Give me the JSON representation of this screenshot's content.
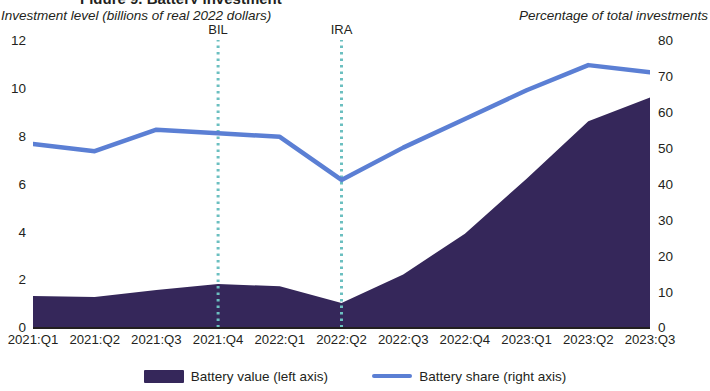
{
  "title_clipped": "Figure 9. Battery investment",
  "axes": {
    "left_title": "Investment level (billions of real 2022 dollars)",
    "right_title": "Percentage of total investments",
    "left_ticks": [
      "12",
      "10",
      "8",
      "6",
      "4",
      "2",
      "0"
    ],
    "right_ticks": [
      "80",
      "70",
      "60",
      "50",
      "40",
      "30",
      "20",
      "10",
      "0"
    ]
  },
  "annotations": [
    {
      "label": "BIL",
      "at_category": "2021:Q4"
    },
    {
      "label": "IRA",
      "at_category": "2022:Q2"
    }
  ],
  "legend": {
    "items": [
      {
        "name": "battery-value",
        "label": "Battery value (left axis)",
        "marker": "area-swatch",
        "color": "#35275a"
      },
      {
        "name": "battery-share",
        "label": "Battery share (right axis)",
        "marker": "line-swatch",
        "color": "#5b7fd4"
      }
    ]
  },
  "colors": {
    "area": "#35275a",
    "line": "#5b7fd4",
    "annotation_line": "#6bbfc0",
    "axis": "#231f20",
    "background": "#ffffff"
  },
  "chart_data": {
    "type": "area",
    "title": "Figure 9. Battery investment",
    "xlabel": "",
    "ylabel": "Investment level (billions of real 2022 dollars)",
    "y2label": "Percentage of total investments",
    "categories": [
      "2021:Q1",
      "2021:Q2",
      "2021:Q3",
      "2021:Q4",
      "2022:Q1",
      "2022:Q2",
      "2022:Q3",
      "2022:Q4",
      "2023:Q1",
      "2023:Q2",
      "2023:Q3"
    ],
    "series": [
      {
        "name": "Battery value (left axis)",
        "type": "area",
        "axis": "left",
        "color": "#35275a",
        "values": [
          1.3,
          1.25,
          1.55,
          1.8,
          1.7,
          1.0,
          2.2,
          3.9,
          6.2,
          8.6,
          9.6
        ]
      },
      {
        "name": "Battery share (right axis)",
        "type": "line",
        "axis": "right",
        "color": "#5b7fd4",
        "values": [
          51,
          49,
          55,
          54,
          53,
          41,
          50,
          58,
          66,
          73,
          71
        ]
      }
    ],
    "ylim": [
      0,
      12
    ],
    "y2lim": [
      0,
      80
    ],
    "yticks": [
      0,
      2,
      4,
      6,
      8,
      10,
      12
    ],
    "y2ticks": [
      0,
      10,
      20,
      30,
      40,
      50,
      60,
      70,
      80
    ],
    "grid": false,
    "legend_position": "bottom",
    "annotations": [
      {
        "label": "BIL",
        "x": "2021:Q4",
        "style": "dotted-vertical",
        "color": "#6bbfc0"
      },
      {
        "label": "IRA",
        "x": "2022:Q2",
        "style": "dotted-vertical",
        "color": "#6bbfc0"
      }
    ]
  }
}
